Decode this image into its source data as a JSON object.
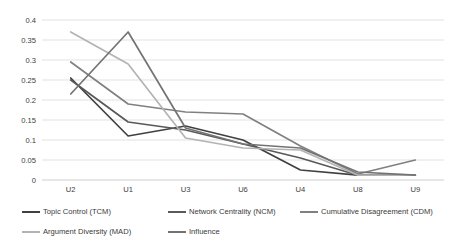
{
  "chart_data": {
    "type": "line",
    "title": "",
    "xlabel": "",
    "ylabel": "",
    "categories": [
      "U2",
      "U1",
      "U3",
      "U6",
      "U4",
      "U8",
      "U9"
    ],
    "ylim": [
      0,
      0.4
    ],
    "yticks": [
      "0",
      "0.05",
      "0.1",
      "0.15",
      "0.2",
      "0.25",
      "0.3",
      "0.35",
      "0.4"
    ],
    "ytick_values": [
      0,
      0.05,
      0.1,
      0.15,
      0.2,
      0.25,
      0.3,
      0.35,
      0.4
    ],
    "grid": true,
    "legend_position": "bottom",
    "series": [
      {
        "name": "Topic Control (TCM)",
        "key": "tcm",
        "color": "#404040",
        "values": [
          0.255,
          0.11,
          0.135,
          0.1,
          0.025,
          0.012,
          0.012
        ]
      },
      {
        "name": "Network Centrality (NCM)",
        "key": "ncm",
        "color": "#595959",
        "values": [
          0.25,
          0.145,
          0.125,
          0.09,
          0.055,
          0.012,
          0.012
        ]
      },
      {
        "name": "Cumulative Disagreement (CDM)",
        "key": "cdm",
        "color": "#808080",
        "values": [
          0.295,
          0.19,
          0.17,
          0.165,
          0.085,
          0.015,
          0.05
        ]
      },
      {
        "name": "Argument Diversity (MAD)",
        "key": "mad",
        "color": "#b3b3b3",
        "values": [
          0.37,
          0.29,
          0.105,
          0.08,
          0.075,
          0.012,
          0.012
        ]
      },
      {
        "name": "Influence",
        "key": "influence",
        "color": "#737373",
        "values": [
          0.215,
          0.37,
          0.13,
          0.09,
          0.08,
          0.02,
          0.012
        ]
      }
    ]
  },
  "legend": {
    "items": [
      {
        "label": "Topic Control (TCM)",
        "color": "#404040"
      },
      {
        "label": "Network Centrality (NCM)",
        "color": "#595959"
      },
      {
        "label": "Cumulative Disagreement (CDM)",
        "color": "#808080"
      },
      {
        "label": "Argument Diversity (MAD)",
        "color": "#b3b3b3"
      },
      {
        "label": "Influence",
        "color": "#737373"
      }
    ]
  }
}
